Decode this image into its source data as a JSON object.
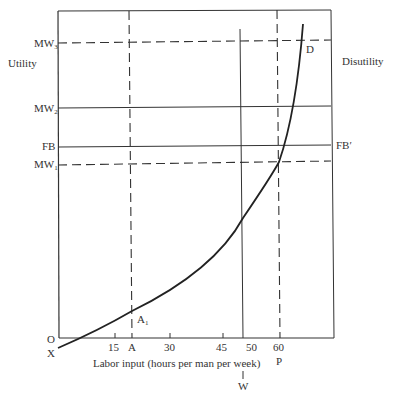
{
  "diagram": {
    "left_axis_label": "Utility",
    "right_axis_label": "Disutility",
    "x_axis_label": "Labor input (hours per man per week)",
    "origin_label": "O",
    "curve_start_label": "X",
    "curve_end_label": "D",
    "point_label": "A",
    "point_label_sub": "1",
    "horizontal_lines": [
      {
        "label": "MW",
        "sub": "3",
        "style": "dashed"
      },
      {
        "label": "MW",
        "sub": "2",
        "style": "solid"
      },
      {
        "label": "FB",
        "right_label": "FB′",
        "style": "solid"
      },
      {
        "label": "MW",
        "sub": "1",
        "style": "dashed"
      }
    ],
    "x_ticks": [
      "15",
      "A",
      "30",
      "45",
      "50",
      "60"
    ],
    "vertical_lines": [
      {
        "label": "A",
        "style": "dashed"
      },
      {
        "label": "W",
        "style": "solid"
      },
      {
        "label": "P",
        "style": "dashed"
      }
    ],
    "w_label": "W",
    "p_label": "P"
  }
}
